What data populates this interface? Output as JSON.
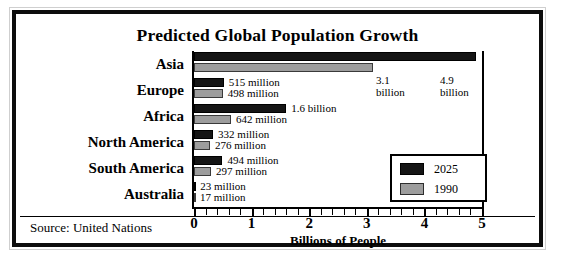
{
  "chart_data": {
    "type": "bar",
    "orientation": "horizontal",
    "title": "Predicted Global Population Growth",
    "xlabel": "Billions of People",
    "ylabel": "",
    "xlim": [
      0,
      5
    ],
    "xticks": [
      0,
      1,
      2,
      3,
      4,
      5
    ],
    "xtick_labels": [
      "0",
      "1",
      "2",
      "3",
      "4",
      "5"
    ],
    "minor_tick_step": 0.2,
    "grid": false,
    "legend_position": "center-right",
    "units": "billions of people",
    "categories": [
      "Asia",
      "Europe",
      "Africa",
      "North America",
      "South America",
      "Australia"
    ],
    "series": [
      {
        "name": "2025",
        "color": "#151515",
        "values": [
          4.9,
          0.515,
          1.6,
          0.332,
          0.494,
          0.023
        ],
        "value_labels": [
          "4.9 billion",
          "515 million",
          "1.6 billion",
          "332 million",
          "494 million",
          "23 million"
        ]
      },
      {
        "name": "1990",
        "color": "#9d9d9d",
        "values": [
          3.1,
          0.498,
          0.642,
          0.276,
          0.297,
          0.017
        ],
        "value_labels": [
          "3.1 billion",
          "498 million",
          "642 million",
          "276 million",
          "297 million",
          "17 million"
        ]
      }
    ],
    "annotations": [
      {
        "text_line1": "3.1",
        "text_line2": "billion",
        "for": "Asia 1990"
      },
      {
        "text_line1": "4.9",
        "text_line2": "billion",
        "for": "Asia 2025"
      }
    ],
    "source_note": "Source:  United Nations"
  },
  "chart": {
    "title": "Predicted Global Population Growth",
    "axis_title": "Billions of People",
    "source": "Source:  United Nations",
    "categories": [
      {
        "label": "Asia"
      },
      {
        "label": "Europe"
      },
      {
        "label": "Africa"
      },
      {
        "label": "North America"
      },
      {
        "label": "South America"
      },
      {
        "label": "Australia"
      }
    ],
    "rows": [
      {
        "category": "Asia",
        "v2025": 4.9,
        "v1990": 3.1,
        "label2025": "",
        "label1990": "",
        "callout_1990_l1": "3.1",
        "callout_1990_l2": "billion",
        "callout_2025_l1": "4.9",
        "callout_2025_l2": "billion"
      },
      {
        "category": "Europe",
        "v2025": 0.515,
        "v1990": 0.498,
        "label2025": "515 million",
        "label1990": "498 million"
      },
      {
        "category": "Africa",
        "v2025": 1.6,
        "v1990": 0.642,
        "label2025": "1.6 billion",
        "label1990": "642 million"
      },
      {
        "category": "North America",
        "v2025": 0.332,
        "v1990": 0.276,
        "label2025": "332 million",
        "label1990": "276 million"
      },
      {
        "category": "South America",
        "v2025": 0.494,
        "v1990": 0.297,
        "label2025": "494 million",
        "label1990": "297 million"
      },
      {
        "category": "Australia",
        "v2025": 0.023,
        "v1990": 0.017,
        "label2025": "23 million",
        "label1990": "17 million"
      }
    ],
    "xticks": [
      "0",
      "1",
      "2",
      "3",
      "4",
      "5"
    ],
    "legend": {
      "entries": [
        {
          "label": "2025",
          "color": "#151515"
        },
        {
          "label": "1990",
          "color": "#9d9d9d"
        }
      ]
    }
  }
}
